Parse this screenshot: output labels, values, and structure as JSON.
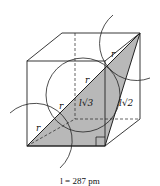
{
  "diagram": {
    "labels": {
      "r1": "r",
      "r2": "r",
      "r3": "r",
      "r4": "r",
      "body_diagonal": "l√3",
      "face_diagonal": "l√2"
    },
    "caption": "l = 287 pm",
    "colors": {
      "shade": "#b8b8b8",
      "line": "#222222"
    }
  }
}
